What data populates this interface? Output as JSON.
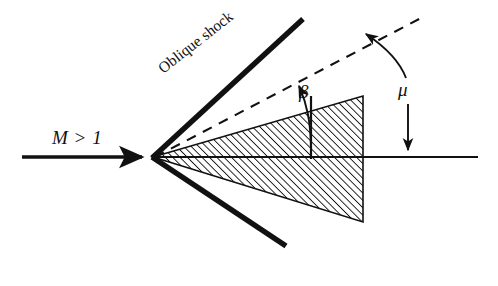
{
  "figure": {
    "type": "technical-diagram",
    "background_color": "#ffffff",
    "ink_color": "#111111",
    "width": 498,
    "height": 286
  },
  "labels": {
    "freestream": "M > 1",
    "shock": "Oblique shock",
    "shock_angle": "β",
    "mach_angle": "μ"
  },
  "geometry": {
    "apex": {
      "x": 153,
      "y": 157
    },
    "centerline": {
      "x1": 153,
      "y1": 157,
      "x2": 478,
      "y2": 157
    },
    "freestream_arrow": {
      "x1": 22,
      "y1": 157,
      "x2": 146,
      "y2": 157
    },
    "upper_shock": {
      "x1": 153,
      "y1": 157,
      "x2": 303,
      "y2": 20,
      "angle_deg": -42
    },
    "lower_shock": {
      "x1": 153,
      "y1": 157,
      "x2": 285,
      "y2": 245,
      "angle_deg": 34
    },
    "mach_line_dashed": {
      "x1": 153,
      "y1": 157,
      "x2": 421,
      "y2": 18,
      "angle_deg": -27
    },
    "wedge_upper_edge": {
      "x1": 153,
      "y1": 157,
      "x2": 363,
      "y2": 96
    },
    "wedge_lower_edge": {
      "x1": 153,
      "y1": 157,
      "x2": 363,
      "y2": 222
    },
    "wedge_base": {
      "x1": 363,
      "y1": 96,
      "x2": 363,
      "y2": 222
    },
    "beta_marker": {
      "x": 310,
      "y_top": 88,
      "y_bottom": 157
    },
    "mu_marker": {
      "x": 408,
      "y_top": 40,
      "y_bottom": 157
    }
  },
  "style": {
    "shock_line_width": 5,
    "centerline_width": 2,
    "dash_pattern": "9 7",
    "hatch_angle_deg": 45,
    "hatch_spacing": 5.2,
    "hatch_width": 1.7
  }
}
